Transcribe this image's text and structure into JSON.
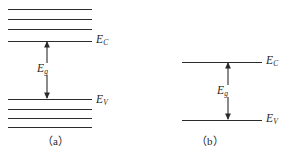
{
  "figure": {
    "width": 289,
    "height": 155,
    "background": "#ffffff",
    "line_color": "#2b2b2b",
    "text_color": "#1f1f1f",
    "type": "energy-band-diagram"
  },
  "panel_a": {
    "caption": "（a）",
    "description": "Energy band diagram with split discrete levels forming conduction and valence bands",
    "conduction_band": {
      "label": "E",
      "subscript": "C",
      "levels": [
        {
          "y": 9,
          "x1": 8,
          "x2": 92
        },
        {
          "y": 19,
          "x1": 8,
          "x2": 92
        },
        {
          "y": 29,
          "x1": 8,
          "x2": 92
        },
        {
          "y": 41,
          "x1": 8,
          "x2": 92
        }
      ]
    },
    "valence_band": {
      "label": "E",
      "subscript": "V",
      "levels": [
        {
          "y": 99,
          "x1": 8,
          "x2": 92
        },
        {
          "y": 109,
          "x1": 8,
          "x2": 92
        },
        {
          "y": 118,
          "x1": 8,
          "x2": 92
        },
        {
          "y": 127,
          "x1": 8,
          "x2": 92
        }
      ]
    },
    "gap": {
      "label": "E",
      "subscript": "g",
      "arrow_x": 47,
      "arrow_top": 41,
      "arrow_bottom": 99,
      "label_x": 36,
      "label_y": 63
    }
  },
  "panel_b": {
    "caption": "（b）",
    "description": "Simplified energy band diagram with single conduction and valence band edges",
    "conduction_band": {
      "label": "E",
      "subscript": "C",
      "levels": [
        {
          "y": 62,
          "x1": 182,
          "x2": 262
        }
      ]
    },
    "valence_band": {
      "label": "E",
      "subscript": "V",
      "levels": [
        {
          "y": 120,
          "x1": 182,
          "x2": 262
        }
      ]
    },
    "gap": {
      "label": "E",
      "subscript": "g",
      "arrow_x": 228,
      "arrow_top": 62,
      "arrow_bottom": 120,
      "label_x": 216,
      "label_y": 85
    }
  },
  "labels": {
    "ec_a_x": 96,
    "ec_a_y": 34,
    "ev_a_x": 96,
    "ev_a_y": 94,
    "ec_b_x": 266,
    "ec_b_y": 55,
    "ev_b_x": 266,
    "ev_b_y": 113,
    "caption_a_x": 42,
    "caption_a_y": 136,
    "caption_b_x": 196,
    "caption_b_y": 136
  }
}
